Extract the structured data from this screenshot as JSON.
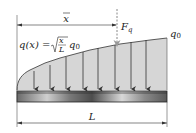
{
  "diagram": {
    "labels": {
      "xbar": "x",
      "force": "F",
      "force_sub": "q",
      "q_func_lhs": "q(x) =",
      "q_func_num": "x",
      "q_func_den": "L",
      "q_func_q": "q",
      "q_func_q_sub": "0",
      "q0": "q",
      "q0_sub": "0",
      "length": "L"
    },
    "load_function": "q(x) = sqrt(x/L) * q0",
    "arrow_count": 8,
    "colors": {
      "load_fill": "#d4d4d4",
      "lines": "#333333",
      "beam_dark": "#555555",
      "beam_light": "#e0e0e0",
      "force_arrow": "#888888"
    }
  }
}
